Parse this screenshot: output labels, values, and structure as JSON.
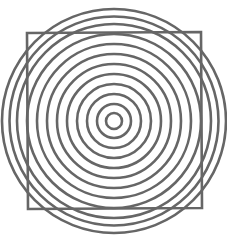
{
  "figure": {
    "width": 227,
    "height": 239,
    "background": "#ffffff",
    "stroke_color": "#666666",
    "circles": {
      "center": [
        114,
        121
      ],
      "radii": [
        8,
        17,
        27,
        37,
        47,
        57,
        67,
        77,
        87,
        97,
        104.5,
        112
      ],
      "stroke_width": 2.6
    },
    "square": {
      "corners": [
        [
          27,
          33
        ],
        [
          201,
          32
        ],
        [
          202,
          208
        ],
        [
          28,
          209
        ]
      ],
      "stroke_width": 2.6
    }
  }
}
